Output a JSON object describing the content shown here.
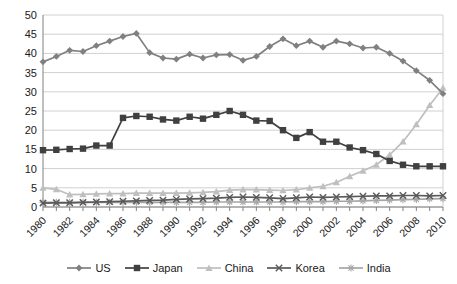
{
  "chart_data": {
    "type": "line",
    "title": "",
    "xlabel": "",
    "ylabel": "",
    "x": [
      1980,
      1981,
      1982,
      1983,
      1984,
      1985,
      1986,
      1987,
      1988,
      1989,
      1990,
      1991,
      1992,
      1993,
      1994,
      1995,
      1996,
      1997,
      1998,
      1999,
      2000,
      2001,
      2002,
      2003,
      2004,
      2005,
      2006,
      2007,
      2008,
      2009,
      2010
    ],
    "xtick_labels": [
      "1980",
      "1982",
      "1984",
      "1986",
      "1988",
      "1990",
      "1992",
      "1994",
      "1996",
      "1998",
      "2000",
      "2002",
      "2004",
      "2006",
      "2008",
      "2010"
    ],
    "xtick_values": [
      1980,
      1982,
      1984,
      1986,
      1988,
      1990,
      1992,
      1994,
      1996,
      1998,
      2000,
      2002,
      2004,
      2006,
      2008,
      2010
    ],
    "ytick_labels": [
      "0",
      "5",
      "10",
      "15",
      "20",
      "25",
      "30",
      "35",
      "40",
      "45",
      "50"
    ],
    "ytick_values": [
      0,
      5,
      10,
      15,
      20,
      25,
      30,
      35,
      40,
      45,
      50
    ],
    "xlim": [
      1980,
      2010
    ],
    "ylim": [
      0,
      50
    ],
    "grid": "horizontal",
    "legend_position": "bottom",
    "series": [
      {
        "name": "US",
        "color": "#808080",
        "marker": "diamond",
        "values": [
          37.8,
          39.2,
          40.8,
          40.5,
          42.0,
          43.2,
          44.4,
          45.2,
          40.2,
          38.8,
          38.5,
          39.8,
          38.8,
          39.6,
          39.7,
          38.2,
          39.2,
          41.8,
          43.8,
          42.0,
          43.2,
          41.6,
          43.2,
          42.5,
          41.4,
          41.6,
          40.0,
          38.0,
          35.5,
          33.0,
          29.5
        ]
      },
      {
        "name": "Japan",
        "color": "#404040",
        "marker": "square",
        "values": [
          14.8,
          14.9,
          15.1,
          15.2,
          16.0,
          16.0,
          23.2,
          23.7,
          23.5,
          22.8,
          22.5,
          23.5,
          23.0,
          24.0,
          25.0,
          24.0,
          22.5,
          22.4,
          20.0,
          18.0,
          19.5,
          17.0,
          17.0,
          15.5,
          14.8,
          13.8,
          12.0,
          11.0,
          10.6,
          10.6,
          10.6
        ]
      },
      {
        "name": "China",
        "color": "#bfbfbf",
        "marker": "triangle",
        "values": [
          5.0,
          4.6,
          3.2,
          3.3,
          3.4,
          3.5,
          3.5,
          3.6,
          3.6,
          3.6,
          3.6,
          3.7,
          3.8,
          4.0,
          4.4,
          4.5,
          4.5,
          4.4,
          4.3,
          4.5,
          5.0,
          5.4,
          6.4,
          8.0,
          9.4,
          11.0,
          13.6,
          17.0,
          21.5,
          26.5,
          31.0
        ]
      },
      {
        "name": "Korea",
        "color": "#595959",
        "marker": "x",
        "values": [
          1.0,
          1.1,
          1.1,
          1.2,
          1.3,
          1.4,
          1.5,
          1.6,
          1.7,
          1.8,
          2.0,
          2.1,
          2.2,
          2.3,
          2.5,
          2.6,
          2.5,
          2.4,
          2.2,
          2.4,
          2.6,
          2.5,
          2.6,
          2.7,
          2.8,
          2.9,
          2.9,
          3.0,
          3.0,
          2.9,
          3.0
        ]
      },
      {
        "name": "India",
        "color": "#a6a6a6",
        "marker": "star",
        "values": [
          1.2,
          1.2,
          1.2,
          1.2,
          1.2,
          1.2,
          1.2,
          1.2,
          1.2,
          1.2,
          1.2,
          1.2,
          1.2,
          1.3,
          1.3,
          1.3,
          1.3,
          1.3,
          1.3,
          1.4,
          1.4,
          1.4,
          1.5,
          1.5,
          1.6,
          1.7,
          1.8,
          1.9,
          2.0,
          2.1,
          2.2
        ]
      }
    ]
  },
  "legend": {
    "items": [
      {
        "label": "US"
      },
      {
        "label": "Japan"
      },
      {
        "label": "China"
      },
      {
        "label": "Korea"
      },
      {
        "label": "India"
      }
    ]
  },
  "colors": {
    "gridline": "#d0d0d0",
    "axis": "#808080",
    "text": "#1a1a1a",
    "background": "#ffffff"
  }
}
